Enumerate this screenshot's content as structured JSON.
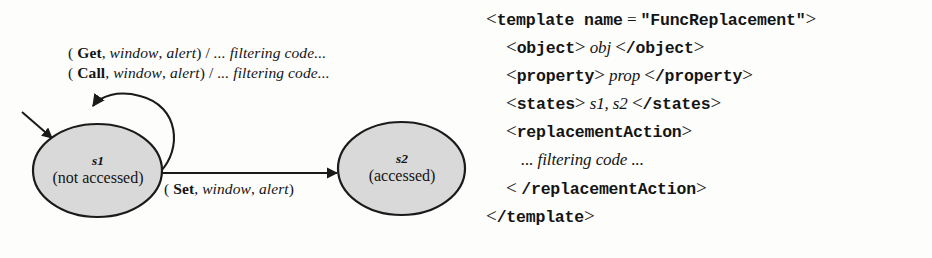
{
  "figure": {
    "kind": "state-machine-and-xml-template",
    "background_color": "#fdfdfc",
    "ink_color": "#141414"
  },
  "diagram": {
    "title": "",
    "state_fill_color": "#d9d9d9",
    "state_stroke_color": "#1a1a1a",
    "states": [
      {
        "id": "s1",
        "name": "s1",
        "description": "(not accessed)",
        "initial": true
      },
      {
        "id": "s2",
        "name": "s2",
        "description": "(accessed)",
        "initial": false
      }
    ],
    "transitions": [
      {
        "id": "get-self-loop",
        "from": "s1",
        "to": "s1",
        "open_paren": "( ",
        "event": "Get",
        "comma1": ", ",
        "arg1": "window",
        "comma2": ", ",
        "arg2": "alert",
        "close_paren": ") / ",
        "action": "... filtering code...",
        "full_text": "( Get, window, alert) / ... filtering code..."
      },
      {
        "id": "call-self-loop",
        "from": "s1",
        "to": "s1",
        "open_paren": "( ",
        "event": "Call",
        "comma1": ", ",
        "arg1": "window",
        "comma2": ", ",
        "arg2": "alert",
        "close_paren": ") / ",
        "action": "... filtering code...",
        "full_text": "( Call, window, alert) / ... filtering code..."
      },
      {
        "id": "set-transition",
        "from": "s1",
        "to": "s2",
        "open_paren": "( ",
        "event": "Set",
        "comma1": ", ",
        "arg1": "window",
        "comma2": ", ",
        "arg2": "alert",
        "close_paren": ")",
        "action": "",
        "full_text": "( Set, window, alert)"
      }
    ]
  },
  "code": {
    "language": "xml",
    "lines": [
      {
        "id": "line-template-open",
        "open_angle": "<",
        "tag": "template name",
        "equals": " = ",
        "value": "\"FuncReplacement\"",
        "close_angle": ">"
      },
      {
        "id": "line-object",
        "open_angle": "<",
        "tag": "object",
        "close_angle": ">",
        "value": "obj",
        "end_open_angle": "<",
        "end_tag": "/object",
        "end_close_angle": ">"
      },
      {
        "id": "line-property",
        "open_angle": "<",
        "tag": "property",
        "close_angle": ">",
        "value": "prop",
        "end_open_angle": "<",
        "end_tag": "/property",
        "end_close_angle": ">"
      },
      {
        "id": "line-states",
        "open_angle": "<",
        "tag": "states",
        "close_angle": ">",
        "value": "s1, s2",
        "end_open_angle": "<",
        "end_tag": "/states",
        "end_close_angle": ">"
      },
      {
        "id": "line-replacementaction-open",
        "open_angle": "<",
        "tag": "replacementAction",
        "close_angle": ">"
      },
      {
        "id": "line-filtering-code",
        "value": "... filtering code ..."
      },
      {
        "id": "line-replacementaction-close",
        "open_angle": "< ",
        "tag": "/replacementAction",
        "close_angle": ">"
      },
      {
        "id": "line-template-close",
        "open_angle": "<",
        "tag": "/template",
        "close_angle": ">"
      }
    ]
  }
}
